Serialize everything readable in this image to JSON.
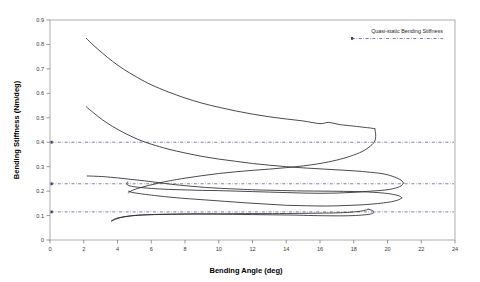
{
  "chart_data": {
    "type": "line",
    "title": "",
    "xlabel": "Bending Angle (deg)",
    "ylabel": "Bending Stiffness (Nm/deg)",
    "xlim": [
      0,
      24
    ],
    "ylim": [
      0,
      0.9
    ],
    "xticks": [
      "0",
      "2",
      "4",
      "6",
      "8",
      "10",
      "12",
      "14",
      "16",
      "18",
      "20",
      "22",
      "24"
    ],
    "yticks": [
      "0",
      "0.1",
      "0.2",
      "0.3",
      "0.4",
      "0.5",
      "0.6",
      "0.7",
      "0.8",
      "0.9"
    ],
    "grid": false,
    "legend_position": "top-right",
    "legend": [
      {
        "name": "Quasi-static Bending Stiffness",
        "style": "dash-dot",
        "color": "#4a4a76"
      }
    ],
    "reference_lines": [
      {
        "name": "quasi-static-high",
        "y": 0.4
      },
      {
        "name": "quasi-static-mid",
        "y": 0.23
      },
      {
        "name": "quasi-static-low",
        "y": 0.115
      }
    ],
    "series": [
      {
        "name": "Loop 1 loading (upper)",
        "points": [
          [
            2.15,
            0.825
          ],
          [
            2.6,
            0.795
          ],
          [
            3.1,
            0.765
          ],
          [
            3.7,
            0.731
          ],
          [
            4.4,
            0.697
          ],
          [
            5.2,
            0.664
          ],
          [
            6.0,
            0.635
          ],
          [
            7.0,
            0.606
          ],
          [
            8.0,
            0.581
          ],
          [
            9.0,
            0.56
          ],
          [
            10.0,
            0.543
          ],
          [
            11.0,
            0.528
          ],
          [
            12.0,
            0.515
          ],
          [
            13.0,
            0.504
          ],
          [
            14.0,
            0.495
          ],
          [
            15.0,
            0.487
          ],
          [
            16.0,
            0.476
          ],
          [
            16.5,
            0.481
          ],
          [
            17.2,
            0.472
          ],
          [
            18.0,
            0.466
          ],
          [
            18.6,
            0.461
          ],
          [
            19.0,
            0.458
          ],
          [
            19.25,
            0.455
          ]
        ]
      },
      {
        "name": "Loop 1 unloading (lower)",
        "points": [
          [
            19.25,
            0.455
          ],
          [
            19.3,
            0.43
          ],
          [
            19.25,
            0.405
          ],
          [
            19.0,
            0.385
          ],
          [
            18.5,
            0.362
          ],
          [
            17.8,
            0.343
          ],
          [
            17.0,
            0.327
          ],
          [
            16.0,
            0.313
          ],
          [
            15.0,
            0.303
          ],
          [
            14.0,
            0.296
          ],
          [
            13.0,
            0.29
          ],
          [
            12.0,
            0.285
          ],
          [
            11.0,
            0.279
          ],
          [
            10.0,
            0.272
          ],
          [
            9.0,
            0.263
          ],
          [
            8.0,
            0.253
          ],
          [
            7.0,
            0.241
          ],
          [
            6.2,
            0.229
          ],
          [
            5.5,
            0.217
          ],
          [
            4.95,
            0.205
          ],
          [
            4.7,
            0.196
          ],
          [
            4.65,
            0.192
          ]
        ]
      },
      {
        "name": "Loop 2 loading (upper)",
        "points": [
          [
            2.15,
            0.545
          ],
          [
            2.6,
            0.519
          ],
          [
            3.1,
            0.492
          ],
          [
            3.7,
            0.465
          ],
          [
            4.4,
            0.438
          ],
          [
            5.2,
            0.412
          ],
          [
            6.0,
            0.392
          ],
          [
            7.0,
            0.372
          ],
          [
            8.0,
            0.356
          ],
          [
            9.0,
            0.342
          ],
          [
            10.0,
            0.331
          ],
          [
            11.0,
            0.322
          ],
          [
            12.0,
            0.313
          ],
          [
            13.0,
            0.306
          ],
          [
            14.0,
            0.3
          ],
          [
            15.0,
            0.295
          ],
          [
            16.0,
            0.291
          ],
          [
            17.0,
            0.287
          ],
          [
            18.0,
            0.283
          ],
          [
            19.0,
            0.277
          ],
          [
            19.8,
            0.27
          ],
          [
            20.4,
            0.258
          ],
          [
            20.8,
            0.245
          ],
          [
            20.95,
            0.233
          ]
        ]
      },
      {
        "name": "Loop 2 unloading (lower)",
        "points": [
          [
            20.95,
            0.233
          ],
          [
            20.8,
            0.221
          ],
          [
            20.4,
            0.211
          ],
          [
            19.8,
            0.204
          ],
          [
            19.0,
            0.2
          ],
          [
            18.0,
            0.195
          ],
          [
            17.0,
            0.192
          ],
          [
            16.0,
            0.191
          ],
          [
            15.0,
            0.192
          ],
          [
            14.0,
            0.194
          ],
          [
            13.0,
            0.196
          ],
          [
            12.0,
            0.198
          ],
          [
            11.0,
            0.2
          ],
          [
            10.0,
            0.202
          ],
          [
            9.0,
            0.203
          ],
          [
            8.0,
            0.205
          ],
          [
            7.0,
            0.207
          ],
          [
            6.0,
            0.211
          ],
          [
            5.2,
            0.216
          ],
          [
            4.75,
            0.221
          ],
          [
            4.55,
            0.228
          ],
          [
            4.6,
            0.237
          ]
        ]
      },
      {
        "name": "Loop 3 upper branch",
        "points": [
          [
            2.2,
            0.262
          ],
          [
            2.6,
            0.261
          ],
          [
            3.2,
            0.259
          ],
          [
            4.0,
            0.254
          ],
          [
            4.8,
            0.248
          ],
          [
            5.6,
            0.242
          ],
          [
            6.4,
            0.235
          ],
          [
            7.2,
            0.228
          ],
          [
            8.2,
            0.221
          ],
          [
            9.2,
            0.215
          ],
          [
            10.2,
            0.211
          ],
          [
            11.2,
            0.208
          ],
          [
            12.2,
            0.205
          ],
          [
            13.4,
            0.203
          ],
          [
            14.6,
            0.201
          ],
          [
            16.0,
            0.2
          ],
          [
            17.4,
            0.199
          ],
          [
            18.6,
            0.197
          ],
          [
            19.6,
            0.193
          ],
          [
            20.3,
            0.187
          ],
          [
            20.7,
            0.18
          ],
          [
            20.85,
            0.172
          ]
        ]
      },
      {
        "name": "Loop 3 lower branch",
        "points": [
          [
            20.85,
            0.172
          ],
          [
            20.6,
            0.163
          ],
          [
            20.1,
            0.155
          ],
          [
            19.4,
            0.149
          ],
          [
            18.5,
            0.144
          ],
          [
            17.5,
            0.141
          ],
          [
            16.4,
            0.139
          ],
          [
            15.2,
            0.14
          ],
          [
            14.0,
            0.142
          ],
          [
            12.8,
            0.147
          ],
          [
            11.6,
            0.152
          ],
          [
            10.4,
            0.158
          ],
          [
            9.2,
            0.164
          ],
          [
            8.0,
            0.17
          ],
          [
            7.0,
            0.176
          ],
          [
            6.2,
            0.182
          ],
          [
            5.5,
            0.188
          ],
          [
            5.0,
            0.193
          ],
          [
            4.75,
            0.197
          ],
          [
            4.65,
            0.2
          ]
        ]
      },
      {
        "name": "Loop 4 upper branch",
        "points": [
          [
            18.85,
            0.126
          ],
          [
            19.1,
            0.121
          ],
          [
            19.2,
            0.115
          ],
          [
            19.15,
            0.11
          ],
          [
            18.9,
            0.105
          ],
          [
            18.3,
            0.101
          ],
          [
            17.5,
            0.099
          ],
          [
            16.6,
            0.099
          ],
          [
            15.6,
            0.1
          ],
          [
            14.4,
            0.102
          ],
          [
            13.2,
            0.103
          ],
          [
            12.0,
            0.104
          ],
          [
            10.8,
            0.105
          ],
          [
            9.6,
            0.106
          ],
          [
            8.4,
            0.106
          ],
          [
            7.2,
            0.105
          ],
          [
            6.2,
            0.104
          ],
          [
            5.4,
            0.102
          ],
          [
            4.8,
            0.099
          ],
          [
            4.3,
            0.094
          ],
          [
            3.95,
            0.089
          ],
          [
            3.75,
            0.083
          ],
          [
            3.65,
            0.078
          ]
        ]
      },
      {
        "name": "Loop 4 return branch",
        "points": [
          [
            3.65,
            0.078
          ],
          [
            4.2,
            0.092
          ],
          [
            5.0,
            0.1
          ],
          [
            6.0,
            0.104
          ],
          [
            7.2,
            0.106
          ],
          [
            8.6,
            0.107
          ],
          [
            10.0,
            0.107
          ],
          [
            11.6,
            0.108
          ],
          [
            13.2,
            0.108
          ],
          [
            14.8,
            0.109
          ],
          [
            16.2,
            0.11
          ],
          [
            17.4,
            0.112
          ],
          [
            18.3,
            0.117
          ],
          [
            18.75,
            0.123
          ],
          [
            18.85,
            0.126
          ]
        ]
      }
    ]
  }
}
